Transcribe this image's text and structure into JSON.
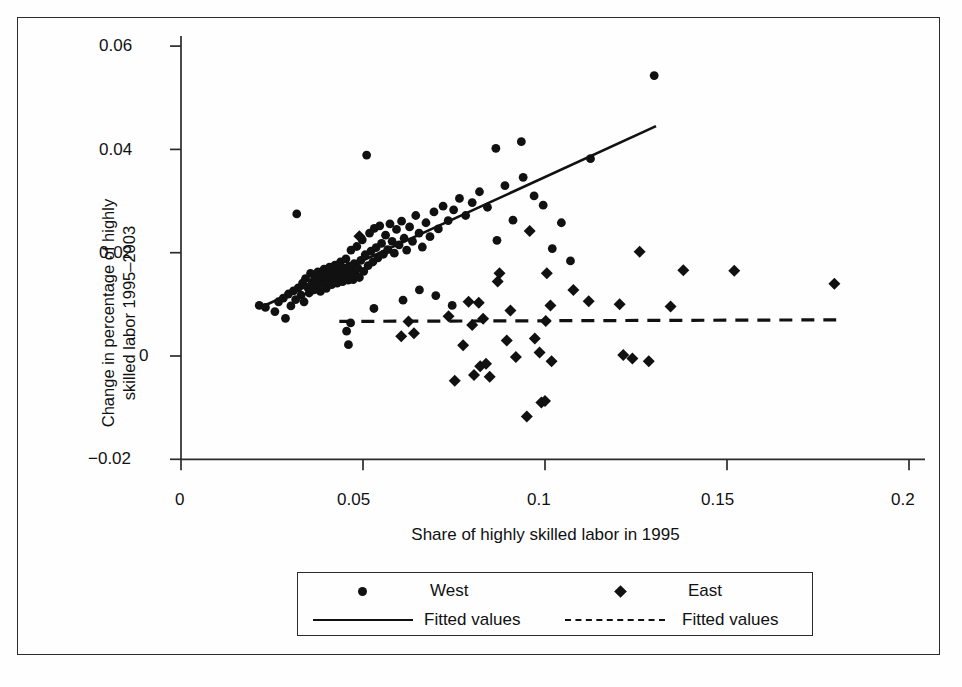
{
  "figure": {
    "background": "#fefefe",
    "frame_color": "#2b2b2b",
    "ink_color": "#111111"
  },
  "axes": {
    "y_label_line1": "Change in percentage of highly",
    "y_label_line2": "skilled labor 1995–2003",
    "x_label": "Share of highly skilled labor in 1995",
    "y_ticks": [
      "0.06",
      "0.04",
      "0.02",
      "0",
      "−0.02"
    ],
    "x_ticks": [
      "0",
      "0.05",
      "0.1",
      "0.15",
      "0.2"
    ]
  },
  "legend": {
    "entries": [
      {
        "marker": "circle-marker",
        "label": "West"
      },
      {
        "marker": "diamond-marker",
        "label": "East"
      },
      {
        "marker": "solid-line-marker",
        "label": "Fitted values"
      },
      {
        "marker": "dashed-line-marker",
        "label": "Fitted values"
      }
    ]
  },
  "chart_data": {
    "type": "scatter",
    "title": "",
    "xlabel": "Share of highly skilled labor in 1995",
    "ylabel": "Change in percentage of highly skilled labor 1995–2003",
    "xlim": [
      0,
      0.2
    ],
    "ylim": [
      -0.02,
      0.06
    ],
    "xticks": [
      0,
      0.05,
      0.1,
      0.15,
      0.2
    ],
    "yticks": [
      -0.02,
      0,
      0.02,
      0.04,
      0.06
    ],
    "grid": false,
    "legend_position": "below-axes",
    "series": [
      {
        "name": "West",
        "marker": "circle",
        "color": "#111111",
        "points": [
          [
            0.0215,
            0.0098
          ],
          [
            0.0232,
            0.0094
          ],
          [
            0.0258,
            0.0086
          ],
          [
            0.0268,
            0.0105
          ],
          [
            0.0281,
            0.0112
          ],
          [
            0.0287,
            0.0073
          ],
          [
            0.0295,
            0.012
          ],
          [
            0.0302,
            0.0097
          ],
          [
            0.0309,
            0.0126
          ],
          [
            0.0315,
            0.0109
          ],
          [
            0.0318,
            0.0275
          ],
          [
            0.0322,
            0.0132
          ],
          [
            0.033,
            0.0118
          ],
          [
            0.0334,
            0.0141
          ],
          [
            0.0338,
            0.0105
          ],
          [
            0.0342,
            0.015
          ],
          [
            0.0348,
            0.0133
          ],
          [
            0.0352,
            0.0122
          ],
          [
            0.0356,
            0.016
          ],
          [
            0.0361,
            0.0143
          ],
          [
            0.0365,
            0.0128
          ],
          [
            0.0369,
            0.0152
          ],
          [
            0.0372,
            0.0137
          ],
          [
            0.0376,
            0.0163
          ],
          [
            0.0379,
            0.0146
          ],
          [
            0.0383,
            0.0125
          ],
          [
            0.0386,
            0.0156
          ],
          [
            0.039,
            0.014
          ],
          [
            0.0393,
            0.0168
          ],
          [
            0.0396,
            0.0149
          ],
          [
            0.0399,
            0.0131
          ],
          [
            0.0402,
            0.0158
          ],
          [
            0.0405,
            0.0144
          ],
          [
            0.0408,
            0.0172
          ],
          [
            0.0411,
            0.0153
          ],
          [
            0.0414,
            0.0138
          ],
          [
            0.0417,
            0.0162
          ],
          [
            0.042,
            0.0147
          ],
          [
            0.0423,
            0.0176
          ],
          [
            0.0426,
            0.0155
          ],
          [
            0.0429,
            0.0141
          ],
          [
            0.0432,
            0.0166
          ],
          [
            0.0435,
            0.015
          ],
          [
            0.0438,
            0.0182
          ],
          [
            0.0441,
            0.0159
          ],
          [
            0.0444,
            0.0144
          ],
          [
            0.0447,
            0.017
          ],
          [
            0.045,
            0.0153
          ],
          [
            0.0453,
            0.0188
          ],
          [
            0.0456,
            0.0162
          ],
          [
            0.0459,
            0.0147
          ],
          [
            0.0462,
            0.0174
          ],
          [
            0.0464,
            0.0157
          ],
          [
            0.0467,
            0.0205
          ],
          [
            0.047,
            0.0166
          ],
          [
            0.0473,
            0.0148
          ],
          [
            0.0476,
            0.0179
          ],
          [
            0.0479,
            0.016
          ],
          [
            0.0483,
            0.0212
          ],
          [
            0.0486,
            0.017
          ],
          [
            0.049,
            0.0152
          ],
          [
            0.0494,
            0.0185
          ],
          [
            0.0498,
            0.0225
          ],
          [
            0.0502,
            0.0164
          ],
          [
            0.0506,
            0.0196
          ],
          [
            0.051,
            0.0389
          ],
          [
            0.0514,
            0.0175
          ],
          [
            0.0518,
            0.0238
          ],
          [
            0.0522,
            0.0203
          ],
          [
            0.0527,
            0.0182
          ],
          [
            0.0531,
            0.0247
          ],
          [
            0.0536,
            0.021
          ],
          [
            0.0541,
            0.019
          ],
          [
            0.0546,
            0.0252
          ],
          [
            0.0551,
            0.0218
          ],
          [
            0.0556,
            0.0197
          ],
          [
            0.0562,
            0.0234
          ],
          [
            0.0568,
            0.0206
          ],
          [
            0.0574,
            0.0256
          ],
          [
            0.058,
            0.0222
          ],
          [
            0.0586,
            0.0199
          ],
          [
            0.0592,
            0.0245
          ],
          [
            0.0599,
            0.0215
          ],
          [
            0.0606,
            0.0261
          ],
          [
            0.0613,
            0.0228
          ],
          [
            0.062,
            0.0205
          ],
          [
            0.0628,
            0.025
          ],
          [
            0.0636,
            0.0222
          ],
          [
            0.0645,
            0.0272
          ],
          [
            0.0654,
            0.0238
          ],
          [
            0.0663,
            0.0211
          ],
          [
            0.0673,
            0.0258
          ],
          [
            0.0684,
            0.0231
          ],
          [
            0.0695,
            0.0279
          ],
          [
            0.0707,
            0.0246
          ],
          [
            0.072,
            0.029
          ],
          [
            0.0734,
            0.0262
          ],
          [
            0.0749,
            0.0283
          ],
          [
            0.0765,
            0.0305
          ],
          [
            0.0782,
            0.0272
          ],
          [
            0.08,
            0.0297
          ],
          [
            0.082,
            0.0318
          ],
          [
            0.0842,
            0.0288
          ],
          [
            0.0865,
            0.0402
          ],
          [
            0.0868,
            0.0224
          ],
          [
            0.089,
            0.033
          ],
          [
            0.0912,
            0.0263
          ],
          [
            0.0935,
            0.0415
          ],
          [
            0.094,
            0.0346
          ],
          [
            0.097,
            0.031
          ],
          [
            0.0995,
            0.0292
          ],
          [
            0.102,
            0.0208
          ],
          [
            0.1045,
            0.0258
          ],
          [
            0.107,
            0.0184
          ],
          [
            0.1125,
            0.0382
          ],
          [
            0.13,
            0.0543
          ],
          [
            0.0455,
            0.0048
          ],
          [
            0.046,
            0.0022
          ],
          [
            0.0466,
            0.0064
          ],
          [
            0.053,
            0.0092
          ],
          [
            0.061,
            0.0108
          ],
          [
            0.0655,
            0.0128
          ],
          [
            0.07,
            0.0117
          ],
          [
            0.0745,
            0.0098
          ]
        ]
      },
      {
        "name": "East",
        "marker": "diamond",
        "color": "#111111",
        "points": [
          [
            0.049,
            0.0232
          ],
          [
            0.0605,
            0.0038
          ],
          [
            0.0625,
            0.0067
          ],
          [
            0.064,
            0.0044
          ],
          [
            0.0735,
            0.0077
          ],
          [
            0.0752,
            -0.0048
          ],
          [
            0.0775,
            0.0021
          ],
          [
            0.079,
            0.0105
          ],
          [
            0.08,
            0.006
          ],
          [
            0.0805,
            -0.0037
          ],
          [
            0.0818,
            0.0103
          ],
          [
            0.0822,
            -0.002
          ],
          [
            0.083,
            0.0072
          ],
          [
            0.0838,
            -0.0015
          ],
          [
            0.0848,
            -0.004
          ],
          [
            0.087,
            0.0144
          ],
          [
            0.0875,
            0.016
          ],
          [
            0.0895,
            0.003
          ],
          [
            0.0905,
            0.0088
          ],
          [
            0.092,
            -0.0002
          ],
          [
            0.095,
            -0.0117
          ],
          [
            0.0958,
            0.0242
          ],
          [
            0.0972,
            0.0034
          ],
          [
            0.0985,
            0.0007
          ],
          [
            0.099,
            -0.009
          ],
          [
            0.1,
            -0.0087
          ],
          [
            0.1002,
            0.0068
          ],
          [
            0.1005,
            0.016
          ],
          [
            0.1015,
            0.0098
          ],
          [
            0.1018,
            -0.001
          ],
          [
            0.1078,
            0.0128
          ],
          [
            0.112,
            0.0106
          ],
          [
            0.1205,
            0.01
          ],
          [
            0.1215,
            0.0002
          ],
          [
            0.124,
            -0.0005
          ],
          [
            0.126,
            0.0202
          ],
          [
            0.1285,
            -0.001
          ],
          [
            0.1345,
            0.0096
          ],
          [
            0.138,
            0.0166
          ],
          [
            0.152,
            0.0165
          ],
          [
            0.1795,
            0.014
          ]
        ]
      }
    ],
    "fits": [
      {
        "name": "West fitted values",
        "style": "solid",
        "x0": 0.0215,
        "y0": 0.0093,
        "x1": 0.1305,
        "y1": 0.0445
      },
      {
        "name": "East fitted values",
        "style": "dashed",
        "x0": 0.0435,
        "y0": 0.0067,
        "x1": 0.18,
        "y1": 0.007
      }
    ]
  }
}
